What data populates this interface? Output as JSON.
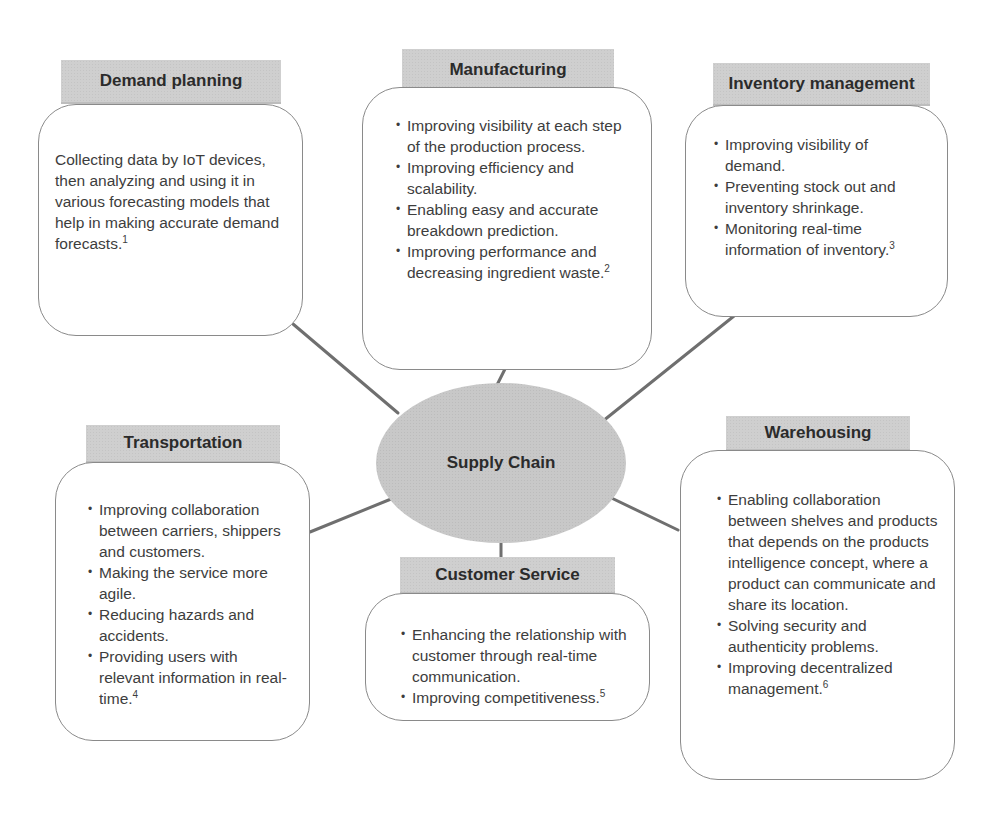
{
  "center": {
    "label": "Supply Chain",
    "fill_color": "#c8c8c8"
  },
  "header_fill_color": "#cfcfcf",
  "nodes": {
    "demand_planning": {
      "title": "Demand planning",
      "text": "Collecting data by IoT devices, then analyzing and using it in various forecasting models that help in making accurate demand forecasts.",
      "ref": "1"
    },
    "manufacturing": {
      "title": "Manufacturing",
      "items": [
        {
          "text": "Improving visibility at each step of the production process.",
          "ref": ""
        },
        {
          "text": "Improving efficiency and scalability.",
          "ref": ""
        },
        {
          "text": "Enabling easy and accurate breakdown prediction.",
          "ref": ""
        },
        {
          "text": "Improving performance and decreasing ingredient waste.",
          "ref": "2"
        }
      ]
    },
    "inventory_management": {
      "title": "Inventory management",
      "items": [
        {
          "text": "Improving visibility of demand.",
          "ref": ""
        },
        {
          "text": "Preventing stock out and inventory shrinkage.",
          "ref": ""
        },
        {
          "text": "Monitoring real-time information of inventory.",
          "ref": "3"
        }
      ]
    },
    "transportation": {
      "title": "Transportation",
      "items": [
        {
          "text": "Improving collaboration between carriers, shippers and customers.",
          "ref": ""
        },
        {
          "text": "Making the service more agile.",
          "ref": ""
        },
        {
          "text": "Reducing hazards and accidents.",
          "ref": ""
        },
        {
          "text": "Providing users with relevant information in real-time.",
          "ref": "4"
        }
      ]
    },
    "customer_service": {
      "title": "Customer Service",
      "items": [
        {
          "text": "Enhancing the relationship with customer through real-time communication.",
          "ref": ""
        },
        {
          "text": "Improving competitiveness.",
          "ref": "5"
        }
      ]
    },
    "warehousing": {
      "title": "Warehousing",
      "items": [
        {
          "text": "Enabling collaboration between shelves and products that depends on the products intelligence concept, where a product can communicate and share its location.",
          "ref": ""
        },
        {
          "text": "Solving security and authenticity problems.",
          "ref": ""
        },
        {
          "text": "Improving decentralized management.",
          "ref": "6"
        }
      ]
    }
  }
}
